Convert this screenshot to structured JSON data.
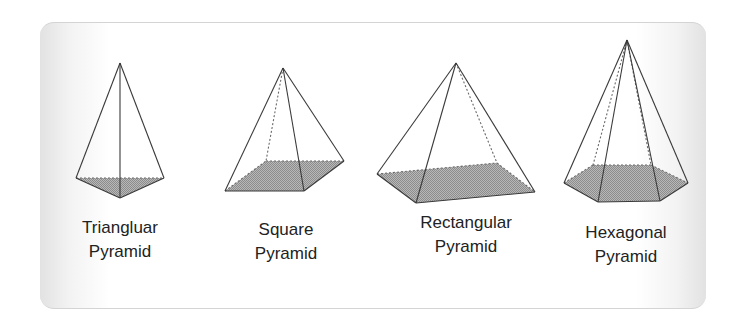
{
  "diagram": {
    "colors": {
      "edge": "#3a3a3a",
      "hidden_edge": "#6a6a6a",
      "base_fill": "#a9a9a9",
      "label_text": "#222222"
    },
    "pyramids": [
      {
        "name_line1": "Triangluar",
        "name_line2": "Pyramid",
        "shape": "triangular"
      },
      {
        "name_line1": "Square",
        "name_line2": "Pyramid",
        "shape": "square"
      },
      {
        "name_line1": "Rectangular",
        "name_line2": "Pyramid",
        "shape": "rectangular"
      },
      {
        "name_line1": "Hexagonal",
        "name_line2": "Pyramid",
        "shape": "hexagonal"
      }
    ]
  }
}
